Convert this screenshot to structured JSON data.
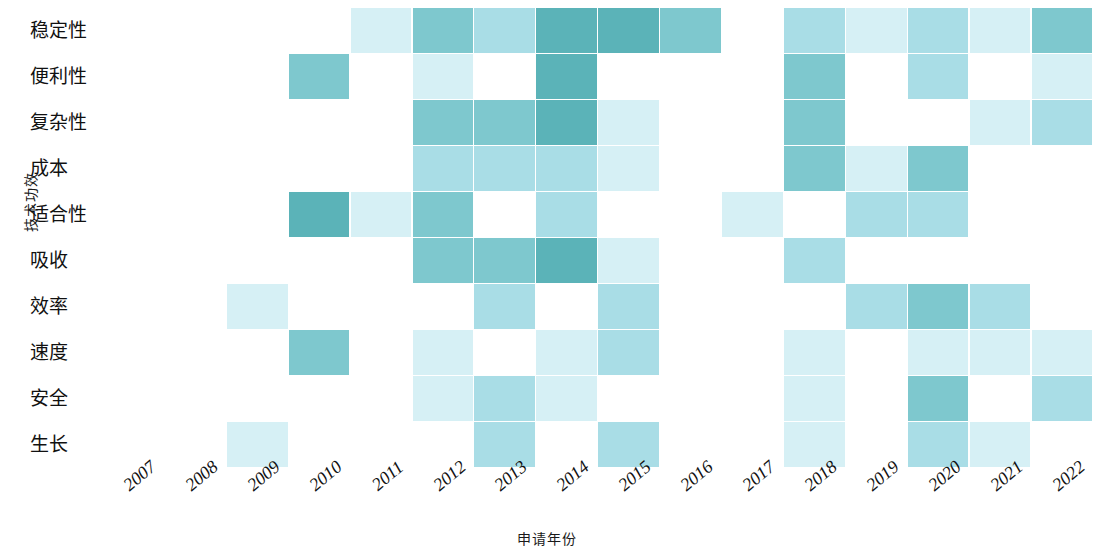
{
  "chart_data": {
    "type": "heatmap",
    "title": "",
    "xlabel": "申请年份",
    "ylabel": "技术功效",
    "grid": false,
    "legend": null,
    "colorscale": {
      "empty": "#ffffff",
      "low": "#d6f0f5",
      "mid": "#a9dde6",
      "high": "#7ec8ce",
      "max": "#5bb3b8"
    },
    "x": [
      "2007",
      "2008",
      "2009",
      "2010",
      "2011",
      "2012",
      "2013",
      "2014",
      "2015",
      "2016",
      "2017",
      "2018",
      "2019",
      "2020",
      "2021",
      "2022"
    ],
    "y": [
      "稳定性",
      "便利性",
      "复杂性",
      "成本",
      "适合性",
      "吸收",
      "效率",
      "速度",
      "安全",
      "生长"
    ],
    "rows": [
      {
        "label": "稳定性",
        "values": [
          0,
          0,
          0,
          0,
          1,
          3,
          2,
          4,
          4,
          3,
          0,
          2,
          1,
          2,
          1,
          3
        ]
      },
      {
        "label": "便利性",
        "values": [
          0,
          0,
          0,
          3,
          0,
          1,
          0,
          4,
          0,
          0,
          0,
          3,
          0,
          2,
          0,
          1
        ]
      },
      {
        "label": "复杂性",
        "values": [
          0,
          0,
          0,
          0,
          0,
          3,
          3,
          4,
          1,
          0,
          0,
          3,
          0,
          0,
          1,
          2
        ]
      },
      {
        "label": "成本",
        "values": [
          0,
          0,
          0,
          0,
          0,
          2,
          2,
          2,
          1,
          0,
          0,
          3,
          1,
          3,
          0,
          0
        ]
      },
      {
        "label": "适合性",
        "values": [
          0,
          0,
          0,
          4,
          1,
          3,
          0,
          2,
          0,
          0,
          1,
          0,
          2,
          2,
          0,
          0
        ]
      },
      {
        "label": "吸收",
        "values": [
          0,
          0,
          0,
          0,
          0,
          3,
          3,
          4,
          1,
          0,
          0,
          2,
          0,
          0,
          0,
          0
        ]
      },
      {
        "label": "效率",
        "values": [
          0,
          0,
          1,
          0,
          0,
          0,
          2,
          0,
          2,
          0,
          0,
          0,
          2,
          3,
          2,
          0
        ]
      },
      {
        "label": "速度",
        "values": [
          0,
          0,
          0,
          3,
          0,
          1,
          0,
          1,
          2,
          0,
          0,
          1,
          0,
          1,
          1,
          1
        ]
      },
      {
        "label": "安全",
        "values": [
          0,
          0,
          0,
          0,
          0,
          1,
          2,
          1,
          0,
          0,
          0,
          1,
          0,
          3,
          0,
          2
        ]
      },
      {
        "label": "生长",
        "values": [
          0,
          0,
          1,
          0,
          0,
          0,
          2,
          0,
          2,
          0,
          0,
          1,
          0,
          2,
          1,
          0
        ]
      }
    ]
  },
  "axes": {
    "y_title": "技术功效",
    "x_title": "申请年份",
    "y_ticks": [
      "稳定性",
      "便利性",
      "复杂性",
      "成本",
      "适合性",
      "吸收",
      "效率",
      "速度",
      "安全",
      "生长"
    ],
    "x_ticks": [
      "2007",
      "2008",
      "2009",
      "2010",
      "2011",
      "2012",
      "2013",
      "2014",
      "2015",
      "2016",
      "2017",
      "2018",
      "2019",
      "2020",
      "2021",
      "2022"
    ]
  }
}
